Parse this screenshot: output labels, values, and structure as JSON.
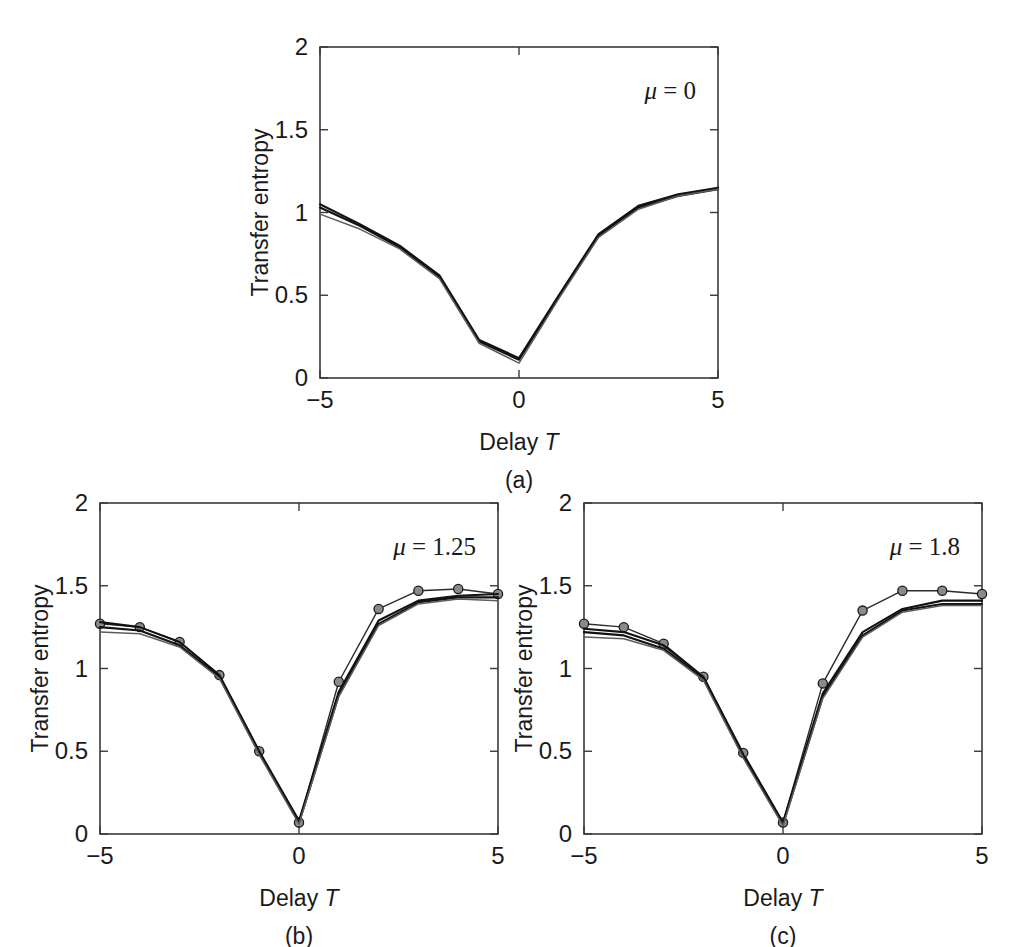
{
  "figure": {
    "axis_titles": {
      "x_prefix": "Delay ",
      "x_symbol": "T",
      "y": "Transfer entropy"
    },
    "y_ticks": [
      "0",
      "0.5",
      "1",
      "1.5",
      "2"
    ],
    "x_ticks": [
      "−5",
      "0",
      "5"
    ]
  },
  "chart_data": [
    {
      "type": "line",
      "panel": "a",
      "caption": "(a)",
      "annotation": "μ = 0",
      "annotation_symbol": "μ",
      "annotation_value": "= 0",
      "title": "",
      "xlabel": "Delay T",
      "ylabel": "Transfer entropy",
      "xlim": [
        -5,
        5
      ],
      "ylim": [
        0,
        2
      ],
      "xticks": [
        -5,
        0,
        5
      ],
      "yticks": [
        0,
        0.5,
        1,
        1.5,
        2
      ],
      "grid": false,
      "legend": "none",
      "has_markers": false,
      "x": [
        -5,
        -4,
        -3,
        -2,
        -1,
        0,
        1,
        2,
        3,
        4,
        5
      ],
      "series": [
        {
          "name": "ensemble-upper",
          "style": "thick",
          "values": [
            1.05,
            0.93,
            0.8,
            0.62,
            0.23,
            0.12,
            0.5,
            0.87,
            1.04,
            1.11,
            1.15
          ]
        },
        {
          "name": "ensemble-mid",
          "style": "thick",
          "values": [
            1.03,
            0.92,
            0.79,
            0.61,
            0.22,
            0.11,
            0.49,
            0.86,
            1.03,
            1.1,
            1.14
          ]
        },
        {
          "name": "ensemble-lower",
          "style": "faint",
          "values": [
            0.99,
            0.9,
            0.78,
            0.6,
            0.21,
            0.09,
            0.48,
            0.85,
            1.02,
            1.1,
            1.14
          ]
        }
      ]
    },
    {
      "type": "line",
      "panel": "b",
      "caption": "(b)",
      "annotation": "μ = 1.25",
      "annotation_symbol": "μ",
      "annotation_value": "= 1.25",
      "title": "",
      "xlabel": "Delay T",
      "ylabel": "Transfer entropy",
      "xlim": [
        -5,
        5
      ],
      "ylim": [
        0,
        2
      ],
      "xticks": [
        -5,
        0,
        5
      ],
      "yticks": [
        0,
        0.5,
        1,
        1.5,
        2
      ],
      "grid": false,
      "legend": "none",
      "has_markers": true,
      "x": [
        -5,
        -4,
        -3,
        -2,
        -1,
        0,
        1,
        2,
        3,
        4,
        5
      ],
      "series": [
        {
          "name": "marked-line",
          "style": "marked",
          "values": [
            1.27,
            1.25,
            1.16,
            0.96,
            0.5,
            0.07,
            0.92,
            1.36,
            1.47,
            1.48,
            1.45
          ]
        },
        {
          "name": "ensemble-upper",
          "style": "thick",
          "values": [
            1.28,
            1.25,
            1.16,
            0.96,
            0.5,
            0.08,
            0.86,
            1.29,
            1.41,
            1.44,
            1.45
          ]
        },
        {
          "name": "ensemble-mid",
          "style": "thick",
          "values": [
            1.25,
            1.23,
            1.14,
            0.95,
            0.49,
            0.07,
            0.84,
            1.27,
            1.4,
            1.43,
            1.43
          ]
        },
        {
          "name": "ensemble-lower",
          "style": "faint",
          "values": [
            1.22,
            1.21,
            1.13,
            0.94,
            0.48,
            0.06,
            0.83,
            1.26,
            1.39,
            1.42,
            1.41
          ]
        }
      ]
    },
    {
      "type": "line",
      "panel": "c",
      "caption": "(c)",
      "annotation": "μ = 1.8",
      "annotation_symbol": "μ",
      "annotation_value": "= 1.8",
      "title": "",
      "xlabel": "Delay T",
      "ylabel": "Transfer entropy",
      "xlim": [
        -5,
        5
      ],
      "ylim": [
        0,
        2
      ],
      "xticks": [
        -5,
        0,
        5
      ],
      "yticks": [
        0,
        0.5,
        1,
        1.5,
        2
      ],
      "grid": false,
      "legend": "none",
      "has_markers": true,
      "x": [
        -5,
        -4,
        -3,
        -2,
        -1,
        0,
        1,
        2,
        3,
        4,
        5
      ],
      "series": [
        {
          "name": "marked-line",
          "style": "marked",
          "values": [
            1.27,
            1.25,
            1.15,
            0.95,
            0.49,
            0.07,
            0.91,
            1.35,
            1.47,
            1.47,
            1.45
          ]
        },
        {
          "name": "ensemble-upper",
          "style": "thick",
          "values": [
            1.24,
            1.22,
            1.14,
            0.95,
            0.48,
            0.07,
            0.85,
            1.22,
            1.36,
            1.41,
            1.41
          ]
        },
        {
          "name": "ensemble-mid",
          "style": "thick",
          "values": [
            1.22,
            1.2,
            1.12,
            0.94,
            0.47,
            0.06,
            0.83,
            1.2,
            1.35,
            1.39,
            1.39
          ]
        },
        {
          "name": "ensemble-lower",
          "style": "faint",
          "values": [
            1.19,
            1.18,
            1.11,
            0.93,
            0.46,
            0.05,
            0.82,
            1.19,
            1.34,
            1.38,
            1.38
          ]
        }
      ]
    }
  ]
}
